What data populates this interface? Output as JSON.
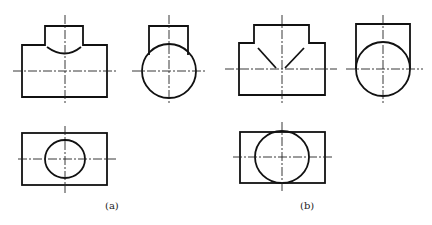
{
  "figure": {
    "type": "orthographic-projection-drawing",
    "colors": {
      "line": "#111111",
      "centerline": "#222222",
      "background": "#ffffff"
    },
    "panels": [
      {
        "label": "(a)",
        "description": "Tee with branch smaller than main pipe: intersection curve shown as arc",
        "views": {
          "front": {
            "main_rect": [
              22,
              45,
              107,
              97
            ],
            "branch_rect": [
              45,
              26,
              83,
              45
            ],
            "intersection": "arc"
          },
          "side": {
            "branch_rect": [
              149,
              26,
              188,
              55
            ],
            "circle": {
              "cx": 169,
              "cy": 71,
              "r": 27
            }
          },
          "top": {
            "rect": [
              22,
              133,
              107,
              185
            ],
            "circle": {
              "cx": 65,
              "cy": 159,
              "rx": 20,
              "ry": 19
            }
          }
        }
      },
      {
        "label": "(b)",
        "description": "Tee with equal diameters: intersection shown as straight lines (V shape)",
        "views": {
          "front": {
            "main_rect": [
              239,
              43,
              325,
              95
            ],
            "branch_rect": [
              254,
              25,
              309,
              43
            ],
            "intersection": "straight-lines"
          },
          "side": {
            "branch_rect": [
              355,
              24,
              410,
              69
            ],
            "circle": {
              "cx": 383,
              "cy": 69,
              "r": 27
            }
          },
          "top": {
            "rect": [
              240,
              132,
              325,
              183
            ],
            "circle": {
              "cx": 282,
              "cy": 157,
              "rx": 27,
              "ry": 26
            }
          }
        }
      }
    ]
  },
  "captions": {
    "a": "(a)",
    "b": "(b)"
  }
}
